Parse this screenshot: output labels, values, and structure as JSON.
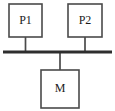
{
  "diagram": {
    "canvas": {
      "width": 115,
      "height": 111,
      "background": "#ffffff"
    },
    "colors": {
      "box_stroke": "#4a4a4a",
      "box_fill": "#ffffff",
      "bus_stroke": "#2e2e2e",
      "stub_stroke": "#4a4a4a",
      "label_color": "#1a1a1a"
    },
    "nodes": [
      {
        "id": "p1",
        "label": "P1",
        "role": "processor",
        "x": 9,
        "y": 4,
        "width": 33,
        "height": 33,
        "label_x": 25.5,
        "label_y": 21.5
      },
      {
        "id": "p2",
        "label": "P2",
        "role": "processor",
        "x": 68,
        "y": 4,
        "width": 34,
        "height": 33,
        "label_x": 85,
        "label_y": 21.5
      },
      {
        "id": "m",
        "label": "M",
        "role": "memory",
        "x": 41,
        "y": 70,
        "width": 38,
        "height": 38,
        "label_x": 60,
        "label_y": 89
      }
    ],
    "bus": {
      "id": "system-bus",
      "label": "",
      "x1": 3,
      "y1": 52,
      "x2": 112,
      "y2": 52
    },
    "connectors": [
      {
        "id": "p1-to-bus",
        "from": "p1",
        "to": "system-bus",
        "x1": 25.5,
        "y1": 37,
        "x2": 25.5,
        "y2": 52
      },
      {
        "id": "p2-to-bus",
        "from": "p2",
        "to": "system-bus",
        "x1": 85,
        "y1": 37,
        "x2": 85,
        "y2": 52
      },
      {
        "id": "bus-to-m",
        "from": "system-bus",
        "to": "m",
        "x1": 60,
        "y1": 52,
        "x2": 60,
        "y2": 70
      }
    ]
  }
}
